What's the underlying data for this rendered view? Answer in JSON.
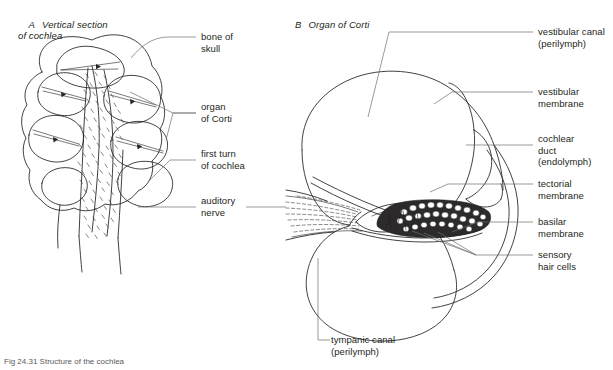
{
  "figure": {
    "caption": "Fig 24.31 Structure of the cochlea",
    "panels": [
      {
        "id": "A",
        "letter": "A",
        "title": "Vertical section\nof cochlea"
      },
      {
        "id": "B",
        "letter": "B",
        "title": "Organ of Corti"
      }
    ]
  },
  "panel_a": {
    "title_letter": "A",
    "title_text": "Vertical section\nof cochlea",
    "labels": [
      {
        "name": "bone-of-skull",
        "text": "bone of\nskull"
      },
      {
        "name": "organ-of-corti",
        "text": "organ\nof Corti"
      },
      {
        "name": "first-turn",
        "text": "first turn\nof cochlea"
      },
      {
        "name": "auditory-nerve",
        "text": "auditory\nnerve"
      }
    ]
  },
  "panel_b": {
    "title_letter": "B",
    "title_text": "Organ of Corti",
    "labels": [
      {
        "name": "vestibular-canal",
        "text": "vestibular canal\n(perilymph)"
      },
      {
        "name": "vestibular-membrane",
        "text": "vestibular\nmembrane"
      },
      {
        "name": "cochlear-duct",
        "text": "cochlear\nduct\n(endolymph)"
      },
      {
        "name": "tectorial-membrane",
        "text": "tectorial\nmembrane"
      },
      {
        "name": "basilar-membrane",
        "text": "basilar\nmembrane"
      },
      {
        "name": "sensory-hair-cells",
        "text": "sensory\nhair cells"
      },
      {
        "name": "tympanic-canal",
        "text": "tympanic canal\n(perilymph)"
      }
    ]
  },
  "colors": {
    "ink": "#231f20",
    "leader": "#6f6f6f",
    "background": "#ffffff",
    "caption": "#5a5a5a"
  }
}
